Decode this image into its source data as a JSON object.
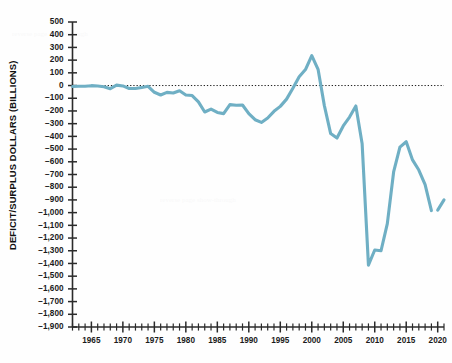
{
  "chart_data": {
    "type": "line",
    "title": "",
    "subtitle": "",
    "xlabel": "",
    "ylabel": "DEFICIT/SURPLUS DOLLARS (BILLIONS)",
    "ylim": [
      -1900,
      500
    ],
    "xlim": [
      1962,
      2021
    ],
    "y_tick_step": 100,
    "x_tick_step": 1,
    "x_label_step": 5,
    "grid": false,
    "legend": null,
    "zero_reference_line": true,
    "line_color": "#6FAFC4",
    "axis_color": "#2b2b2b",
    "ytick_labels": [
      "500",
      "400",
      "300",
      "200",
      "100",
      "0",
      "−100",
      "−200",
      "−300",
      "−400",
      "−500",
      "−600",
      "−700",
      "−800",
      "−900",
      "−1,000",
      "−1,100",
      "−1,200",
      "−1,300",
      "−1,400",
      "−1,500",
      "−1,600",
      "−1,700",
      "−1,800",
      "−1,900"
    ],
    "ytick_values": [
      500,
      400,
      300,
      200,
      100,
      0,
      -100,
      -200,
      -300,
      -400,
      -500,
      -600,
      -700,
      -800,
      -900,
      -1000,
      -1100,
      -1200,
      -1300,
      -1400,
      -1500,
      -1600,
      -1700,
      -1800,
      -1900
    ],
    "xtick_labels": [
      "1965",
      "1970",
      "1975",
      "1980",
      "1985",
      "1990",
      "1995",
      "2000",
      "2005",
      "2010",
      "2015",
      "2020"
    ],
    "xtick_values": [
      1965,
      1970,
      1975,
      1980,
      1985,
      1990,
      1995,
      2000,
      2005,
      2010,
      2015,
      2020
    ],
    "x": [
      1962,
      1963,
      1964,
      1965,
      1966,
      1967,
      1968,
      1969,
      1970,
      1971,
      1972,
      1973,
      1974,
      1975,
      1976,
      1977,
      1978,
      1979,
      1980,
      1981,
      1982,
      1983,
      1984,
      1985,
      1986,
      1987,
      1988,
      1989,
      1990,
      1991,
      1992,
      1993,
      1994,
      1995,
      1996,
      1997,
      1998,
      1999,
      2000,
      2001,
      2002,
      2003,
      2004,
      2005,
      2006,
      2007,
      2008,
      2009,
      2010,
      2011,
      2012,
      2013,
      2014,
      2015,
      2016,
      2017,
      2018,
      2019,
      2020,
      2021
    ],
    "y": [
      -7,
      -5,
      -6,
      -1,
      -4,
      -9,
      -25,
      3,
      -3,
      -23,
      -23,
      -15,
      -6,
      -53,
      -74,
      -54,
      -59,
      -41,
      -74,
      -79,
      -128,
      -208,
      -185,
      -212,
      -221,
      -150,
      -155,
      -153,
      -221,
      -269,
      -290,
      -255,
      -203,
      -164,
      -107,
      -22,
      69,
      126,
      236,
      128,
      -158,
      -378,
      -413,
      -318,
      -248,
      -161,
      -459,
      -1413,
      -1294,
      -1300,
      -1087,
      -680,
      -485,
      -442,
      -585,
      -665,
      -779,
      -984,
      -980,
      -900
    ],
    "series_name": "Federal deficit/surplus",
    "line_break_between": [
      2019,
      2020
    ],
    "notable_points": [
      {
        "year": 2000,
        "value": 236,
        "note": "peak surplus"
      },
      {
        "year": 2009,
        "value": -1413,
        "note": "largest deficit shown"
      },
      {
        "year": 2015,
        "value": -442,
        "note": "post-recession local low deficit"
      }
    ]
  },
  "axes": {
    "y_axis_title": "DEFICIT/SURPLUS DOLLARS (BILLIONS)"
  }
}
